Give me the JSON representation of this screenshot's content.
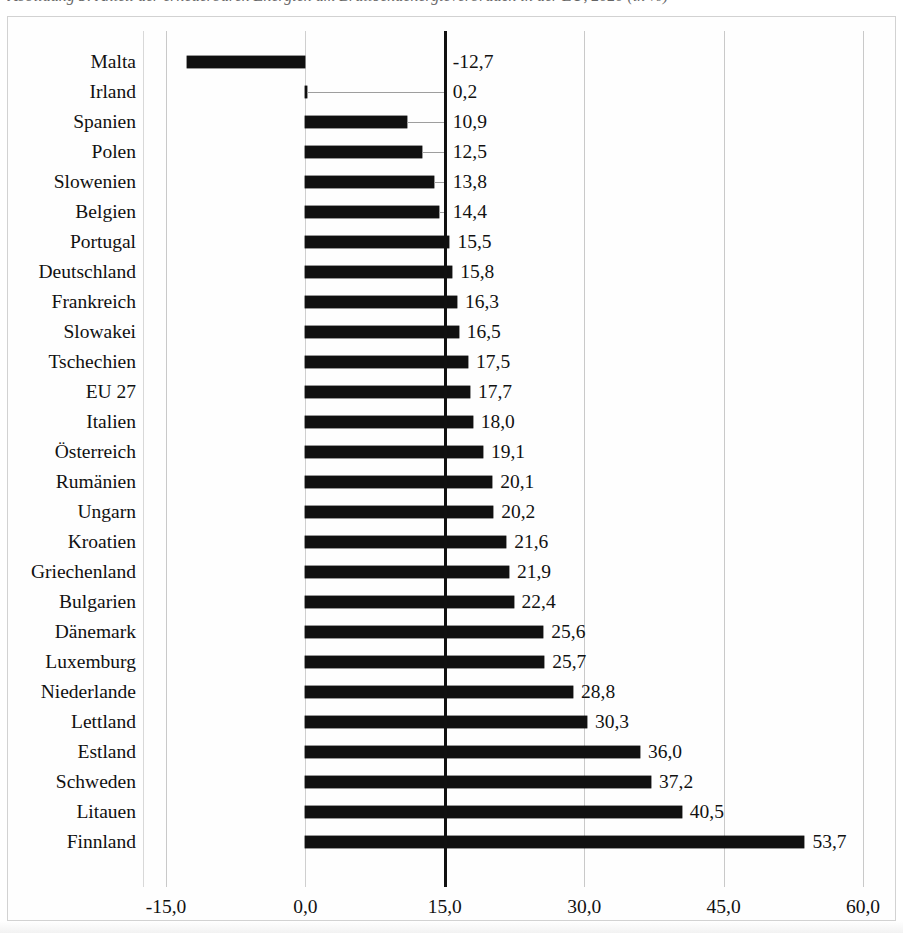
{
  "caption": {
    "text": "Abbildung 5: Anteil der erneuerbaren Energien am Bruttoendenergieverbrauch in der EU, 2020 (in %)"
  },
  "chart_data": {
    "type": "bar",
    "orientation": "horizontal",
    "title": "",
    "xlabel": "",
    "ylabel": "",
    "xlim": [
      -15.0,
      60.0
    ],
    "xticks": [
      "-15,0",
      "0,0",
      "15,0",
      "30,0",
      "45,0",
      "60,0"
    ],
    "xtick_values": [
      -15.0,
      0.0,
      15.0,
      30.0,
      45.0,
      60.0
    ],
    "grid": true,
    "legend": "none",
    "reference_line": 15.0,
    "bar_color": "#101010",
    "gridline_color": "#c9c9c9",
    "categories": [
      "Malta",
      "Irland",
      "Spanien",
      "Polen",
      "Slowenien",
      "Belgien",
      "Portugal",
      "Deutschland",
      "Frankreich",
      "Slowakei",
      "Tschechien",
      "EU 27",
      "Italien",
      "Österreich",
      "Rumänien",
      "Ungarn",
      "Kroatien",
      "Griechenland",
      "Bulgarien",
      "Dänemark",
      "Luxemburg",
      "Niederlande",
      "Lettland",
      "Estland",
      "Schweden",
      "Litauen",
      "Finnland"
    ],
    "values": [
      -12.7,
      0.2,
      10.9,
      12.5,
      13.8,
      14.4,
      15.5,
      15.8,
      16.3,
      16.5,
      17.5,
      17.7,
      18.0,
      19.1,
      20.1,
      20.2,
      21.6,
      21.9,
      22.4,
      25.6,
      25.7,
      28.8,
      30.3,
      36.0,
      37.2,
      40.5,
      53.7
    ],
    "value_labels": [
      "-12,7",
      "0,2",
      "10,9",
      "12,5",
      "13,8",
      "14,4",
      "15,5",
      "15,8",
      "16,3",
      "16,5",
      "17,5",
      "17,7",
      "18,0",
      "19,1",
      "20,1",
      "20,2",
      "21,6",
      "21,9",
      "22,4",
      "25,6",
      "25,7",
      "28,8",
      "30,3",
      "36,0",
      "37,2",
      "40,5",
      "53,7"
    ]
  }
}
